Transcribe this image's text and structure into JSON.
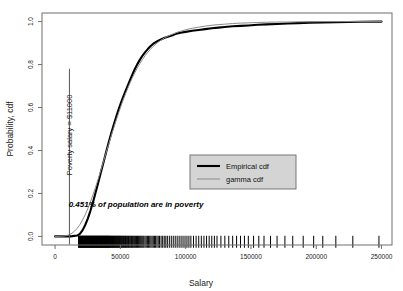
{
  "chart_data": {
    "type": "line",
    "title": "",
    "xlabel": "Salary",
    "ylabel": "Probability, cdf",
    "xlim": [
      -10000,
      258000
    ],
    "ylim": [
      -0.04,
      1.04
    ],
    "xticks": [
      0,
      50000,
      100000,
      150000,
      200000,
      250000
    ],
    "xtick_labels": [
      "0",
      "50000",
      "100000",
      "150000",
      "200000",
      "250000"
    ],
    "yticks": [
      0.0,
      0.2,
      0.4,
      0.6,
      0.8,
      1.0
    ],
    "ytick_labels": [
      "0.0",
      "0.2",
      "0.4",
      "0.6",
      "0.8",
      "1.0"
    ],
    "grid": false,
    "legend_position": "center-right",
    "series": [
      {
        "name": "Empirical cdf",
        "color": "#000000",
        "width": 2.1,
        "points": [
          [
            0,
            0.0
          ],
          [
            12000,
            0.0
          ],
          [
            17000,
            0.004
          ],
          [
            19000,
            0.012
          ],
          [
            21000,
            0.028
          ],
          [
            23000,
            0.052
          ],
          [
            25000,
            0.082
          ],
          [
            27000,
            0.118
          ],
          [
            29000,
            0.158
          ],
          [
            31000,
            0.203
          ],
          [
            33000,
            0.249
          ],
          [
            35000,
            0.296
          ],
          [
            37000,
            0.343
          ],
          [
            39000,
            0.39
          ],
          [
            41000,
            0.436
          ],
          [
            43000,
            0.48
          ],
          [
            45000,
            0.521
          ],
          [
            47000,
            0.56
          ],
          [
            49000,
            0.597
          ],
          [
            51000,
            0.631
          ],
          [
            53000,
            0.662
          ],
          [
            55000,
            0.692
          ],
          [
            57000,
            0.722
          ],
          [
            59000,
            0.751
          ],
          [
            61000,
            0.778
          ],
          [
            63000,
            0.802
          ],
          [
            65000,
            0.823
          ],
          [
            67000,
            0.842
          ],
          [
            69000,
            0.858
          ],
          [
            71000,
            0.872
          ],
          [
            73000,
            0.885
          ],
          [
            75000,
            0.896
          ],
          [
            78000,
            0.908
          ],
          [
            81000,
            0.917
          ],
          [
            84000,
            0.925
          ],
          [
            87000,
            0.931
          ],
          [
            90000,
            0.936
          ],
          [
            93000,
            0.944
          ],
          [
            96000,
            0.948
          ],
          [
            100000,
            0.952
          ],
          [
            105000,
            0.957
          ],
          [
            110000,
            0.961
          ],
          [
            115000,
            0.965
          ],
          [
            120000,
            0.969
          ],
          [
            125000,
            0.972
          ],
          [
            130000,
            0.975
          ],
          [
            136000,
            0.978
          ],
          [
            142000,
            0.98
          ],
          [
            148000,
            0.982
          ],
          [
            155000,
            0.985
          ],
          [
            162000,
            0.987
          ],
          [
            170000,
            0.989
          ],
          [
            178000,
            0.991
          ],
          [
            186000,
            0.993
          ],
          [
            195000,
            0.995
          ],
          [
            205000,
            0.996
          ],
          [
            215000,
            0.997
          ],
          [
            225000,
            0.998
          ],
          [
            235000,
            0.999
          ],
          [
            250000,
            1.0
          ]
        ]
      },
      {
        "name": "gamma cdf",
        "color": "#8a8a8a",
        "width": 1.0,
        "points": [
          [
            0,
            0.0
          ],
          [
            6000,
            0.001
          ],
          [
            9000,
            0.004
          ],
          [
            11000,
            0.008
          ],
          [
            13000,
            0.015
          ],
          [
            15000,
            0.025
          ],
          [
            17000,
            0.038
          ],
          [
            19000,
            0.055
          ],
          [
            21000,
            0.076
          ],
          [
            23000,
            0.1
          ],
          [
            25000,
            0.128
          ],
          [
            27000,
            0.159
          ],
          [
            29000,
            0.193
          ],
          [
            31000,
            0.229
          ],
          [
            33000,
            0.267
          ],
          [
            35000,
            0.307
          ],
          [
            37000,
            0.347
          ],
          [
            39000,
            0.388
          ],
          [
            41000,
            0.428
          ],
          [
            43000,
            0.468
          ],
          [
            45000,
            0.507
          ],
          [
            47000,
            0.545
          ],
          [
            49000,
            0.581
          ],
          [
            51000,
            0.616
          ],
          [
            53000,
            0.649
          ],
          [
            55000,
            0.68
          ],
          [
            57000,
            0.709
          ],
          [
            59000,
            0.736
          ],
          [
            61000,
            0.761
          ],
          [
            63000,
            0.784
          ],
          [
            65000,
            0.805
          ],
          [
            67000,
            0.824
          ],
          [
            69000,
            0.842
          ],
          [
            71000,
            0.857
          ],
          [
            73000,
            0.871
          ],
          [
            75000,
            0.884
          ],
          [
            78000,
            0.9
          ],
          [
            81000,
            0.913
          ],
          [
            84000,
            0.925
          ],
          [
            87000,
            0.934
          ],
          [
            90000,
            0.942
          ],
          [
            93000,
            0.949
          ],
          [
            96000,
            0.955
          ],
          [
            100000,
            0.962
          ],
          [
            105000,
            0.969
          ],
          [
            110000,
            0.974
          ],
          [
            115000,
            0.979
          ],
          [
            120000,
            0.983
          ],
          [
            125000,
            0.986
          ],
          [
            130000,
            0.988
          ],
          [
            136000,
            0.991
          ],
          [
            142000,
            0.993
          ],
          [
            148000,
            0.994
          ],
          [
            155000,
            0.996
          ],
          [
            162000,
            0.997
          ],
          [
            170000,
            0.998
          ],
          [
            178000,
            0.998
          ],
          [
            186000,
            0.999
          ],
          [
            195000,
            0.999
          ],
          [
            205000,
            1.0
          ],
          [
            220000,
            1.0
          ],
          [
            250000,
            1.0
          ]
        ]
      }
    ],
    "vline": {
      "x": 11000,
      "label": "Poverty salary = $11000",
      "y_top": 0.78,
      "color": "#555555"
    },
    "annotation": {
      "text": "0.451% of population are in poverty",
      "x": 62000,
      "y": 0.135
    },
    "rug": {
      "y": -0.025,
      "color": "#000000",
      "values": [
        18000,
        18300,
        18600,
        18900,
        19200,
        19500,
        19800,
        20100,
        20400,
        20700,
        21000,
        21300,
        21600,
        21900,
        22200,
        22500,
        22800,
        23100,
        23400,
        23700,
        24000,
        24300,
        24600,
        24900,
        25200,
        25500,
        25800,
        26100,
        26400,
        26700,
        27000,
        27300,
        27600,
        27900,
        28200,
        28500,
        28800,
        29100,
        29400,
        29700,
        30000,
        30300,
        30600,
        30900,
        31200,
        31500,
        31800,
        32100,
        32400,
        32700,
        33000,
        33300,
        33600,
        33900,
        34200,
        34500,
        34800,
        35100,
        35400,
        35700,
        36000,
        36300,
        36600,
        36900,
        37200,
        37500,
        37800,
        38100,
        38400,
        38700,
        39000,
        39300,
        39600,
        39900,
        40200,
        40500,
        40800,
        41100,
        41400,
        41700,
        42000,
        42400,
        42800,
        43200,
        43600,
        44000,
        44400,
        44800,
        45200,
        45600,
        46000,
        46400,
        46800,
        47200,
        47600,
        48000,
        48400,
        48800,
        49200,
        49600,
        50000,
        50500,
        51000,
        51500,
        52000,
        52500,
        53000,
        53500,
        54000,
        54500,
        55000,
        55600,
        56200,
        56800,
        57400,
        58000,
        58600,
        59200,
        59800,
        60400,
        61000,
        61700,
        62400,
        63100,
        63800,
        64500,
        65200,
        65900,
        66600,
        67300,
        68000,
        68900,
        69800,
        70700,
        71600,
        72500,
        73400,
        74300,
        75200,
        76100,
        77000,
        78000,
        79000,
        80000,
        81200,
        82400,
        83600,
        84800,
        86000,
        87500,
        89000,
        90500,
        92000,
        93500,
        95000,
        96500,
        98000,
        99500,
        101000,
        102500,
        104000,
        106000,
        108000,
        110000,
        112000,
        114000,
        116000,
        118000,
        120000,
        122000,
        124000,
        127000,
        130000,
        133000,
        136000,
        139000,
        142000,
        145000,
        148000,
        152000,
        156000,
        160000,
        165000,
        170000,
        176000,
        182000,
        190000,
        198000,
        205000,
        215000,
        228000,
        248000
      ]
    }
  },
  "legend": {
    "items": [
      {
        "label": "Empirical cdf"
      },
      {
        "label": "gamma cdf"
      }
    ],
    "background": "#d4d4d4",
    "border": "#6b6b6b"
  }
}
